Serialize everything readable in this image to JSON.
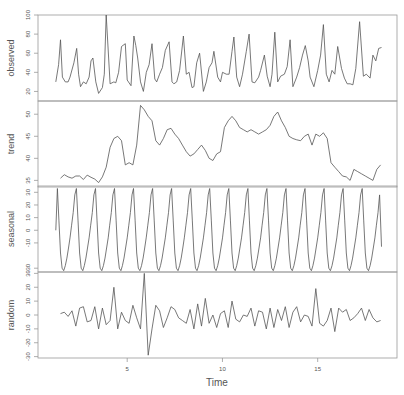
{
  "chart_data": {
    "type": "line",
    "xlabel": "Time",
    "x_range": [
      1,
      18.4
    ],
    "x_ticks": [
      5,
      10,
      15
    ],
    "frequency": 12,
    "grid": false,
    "panels": [
      {
        "name": "observed",
        "ylabel": "observed",
        "ylim": [
          10,
          100
        ],
        "y_ticks": [
          20,
          40,
          60,
          80,
          100
        ],
        "x": [
          1.25,
          1.4,
          1.5,
          1.6,
          1.75,
          1.9,
          2.0,
          2.2,
          2.35,
          2.45,
          2.55,
          2.7,
          2.85,
          3.0,
          3.1,
          3.2,
          3.35,
          3.5,
          3.7,
          3.8,
          3.9,
          4.1,
          4.3,
          4.4,
          4.55,
          4.7,
          4.9,
          5.0,
          5.2,
          5.35,
          5.45,
          5.55,
          5.7,
          5.85,
          6.0,
          6.15,
          6.3,
          6.45,
          6.55,
          6.7,
          6.85,
          7.0,
          7.2,
          7.35,
          7.45,
          7.6,
          7.75,
          7.95,
          8.1,
          8.25,
          8.4,
          8.5,
          8.65,
          8.8,
          9.0,
          9.15,
          9.3,
          9.45,
          9.55,
          9.75,
          9.9,
          10.0,
          10.2,
          10.35,
          10.5,
          10.6,
          10.75,
          10.9,
          11.05,
          11.25,
          11.4,
          11.55,
          11.7,
          11.9,
          12.0,
          12.2,
          12.35,
          12.5,
          12.6,
          12.75,
          12.9,
          13.05,
          13.25,
          13.4,
          13.55,
          13.7,
          13.9,
          14.05,
          14.2,
          14.35,
          14.5,
          14.6,
          14.8,
          15.0,
          15.15,
          15.3,
          15.45,
          15.6,
          15.75,
          15.9,
          16.05,
          16.25,
          16.4,
          16.55,
          16.7,
          16.85,
          17.0,
          17.2,
          17.4,
          17.55,
          17.75,
          17.9,
          18.05,
          18.2,
          18.35
        ],
        "values": [
          30,
          48,
          74,
          35,
          30,
          30,
          35,
          50,
          65,
          38,
          25,
          30,
          28,
          35,
          52,
          55,
          30,
          18,
          24,
          38,
          100,
          28,
          30,
          29,
          40,
          67,
          70,
          32,
          26,
          78,
          68,
          55,
          30,
          20,
          40,
          48,
          70,
          33,
          30,
          38,
          45,
          63,
          72,
          30,
          28,
          30,
          42,
          78,
          38,
          40,
          24,
          25,
          50,
          60,
          20,
          30,
          45,
          50,
          62,
          35,
          30,
          40,
          38,
          38,
          62,
          77,
          35,
          25,
          38,
          62,
          80,
          30,
          29,
          35,
          42,
          58,
          36,
          25,
          38,
          82,
          30,
          36,
          38,
          46,
          74,
          25,
          35,
          45,
          58,
          68,
          52,
          35,
          25,
          42,
          58,
          90,
          38,
          30,
          42,
          38,
          67,
          44,
          34,
          28,
          28,
          27,
          44,
          93,
          36,
          38,
          34,
          58,
          52,
          65,
          66,
          48
        ]
      },
      {
        "name": "trend",
        "ylabel": "trend",
        "ylim": [
          33.5,
          53
        ],
        "y_ticks": [
          35,
          40,
          45,
          50
        ],
        "x": [
          1.5,
          1.7,
          1.9,
          2.1,
          2.3,
          2.5,
          2.7,
          2.9,
          3.1,
          3.3,
          3.5,
          3.7,
          3.9,
          4.1,
          4.3,
          4.5,
          4.7,
          4.9,
          5.1,
          5.3,
          5.5,
          5.7,
          5.9,
          6.1,
          6.3,
          6.5,
          6.7,
          6.9,
          7.1,
          7.3,
          7.5,
          7.7,
          7.9,
          8.1,
          8.3,
          8.5,
          8.7,
          8.9,
          9.1,
          9.3,
          9.5,
          9.7,
          9.9,
          10.1,
          10.3,
          10.5,
          10.7,
          10.9,
          11.1,
          11.3,
          11.5,
          11.7,
          11.9,
          12.1,
          12.3,
          12.5,
          12.7,
          12.9,
          13.1,
          13.3,
          13.5,
          13.7,
          13.9,
          14.1,
          14.3,
          14.5,
          14.7,
          14.9,
          15.1,
          15.3,
          15.5,
          15.7,
          15.9,
          16.1,
          16.3,
          16.5,
          16.7,
          16.9,
          17.1,
          17.3,
          17.5,
          17.7,
          17.9,
          18.1,
          18.3
        ],
        "values": [
          35.5,
          36.3,
          35.8,
          35.5,
          36.0,
          36.0,
          35.2,
          36.2,
          35.7,
          35.3,
          34.5,
          35.8,
          38.0,
          42.5,
          44.5,
          45.0,
          44.0,
          38.5,
          39.0,
          38.5,
          43.0,
          52.0,
          51.0,
          49.5,
          48.5,
          44.0,
          43.0,
          44.5,
          46.5,
          46.8,
          45.5,
          44.5,
          43.0,
          41.5,
          40.5,
          41.0,
          42.0,
          43.0,
          41.8,
          40.0,
          39.5,
          41.0,
          41.5,
          47.0,
          48.5,
          49.5,
          48.5,
          47.0,
          46.5,
          46.0,
          46.5,
          46.0,
          45.5,
          46.0,
          46.5,
          47.5,
          49.5,
          50.5,
          48.5,
          47.0,
          45.0,
          44.5,
          44.2,
          44.0,
          45.0,
          45.5,
          43.0,
          45.5,
          45.0,
          45.8,
          44.5,
          39.0,
          38.0,
          37.0,
          36.0,
          35.8,
          35.0,
          37.5,
          37.0,
          36.5,
          36.0,
          35.5,
          35.0,
          37.5,
          38.5
        ]
      },
      {
        "name": "seasonal",
        "ylabel": "seasonal",
        "ylim": [
          -33,
          35
        ],
        "y_ticks": [
          -30,
          -10,
          0,
          10,
          20,
          30
        ],
        "pattern": [
          33,
          8,
          -18,
          -30,
          -32,
          -28,
          -22,
          -14,
          -6,
          4,
          14,
          28
        ],
        "start_value": 0,
        "end_value": -13
      },
      {
        "name": "random",
        "ylabel": "random",
        "ylim": [
          -31,
          31
        ],
        "y_ticks": [
          -30,
          -20,
          -10,
          0,
          10,
          20,
          30
        ],
        "x": [
          1.5,
          1.7,
          1.9,
          2.1,
          2.3,
          2.5,
          2.7,
          2.9,
          3.1,
          3.3,
          3.5,
          3.7,
          3.9,
          4.1,
          4.3,
          4.5,
          4.7,
          4.9,
          5.1,
          5.3,
          5.5,
          5.7,
          5.9,
          6.1,
          6.3,
          6.5,
          6.7,
          6.9,
          7.1,
          7.3,
          7.5,
          7.7,
          7.9,
          8.1,
          8.3,
          8.5,
          8.7,
          8.9,
          9.1,
          9.3,
          9.5,
          9.7,
          9.9,
          10.1,
          10.3,
          10.5,
          10.7,
          10.9,
          11.1,
          11.3,
          11.5,
          11.7,
          11.9,
          12.1,
          12.3,
          12.5,
          12.7,
          12.9,
          13.1,
          13.3,
          13.5,
          13.7,
          13.9,
          14.1,
          14.3,
          14.5,
          14.7,
          14.9,
          15.1,
          15.3,
          15.5,
          15.7,
          15.9,
          16.1,
          16.3,
          16.5,
          16.7,
          16.9,
          17.1,
          17.3,
          17.5,
          17.7,
          17.9,
          18.1,
          18.3
        ],
        "values": [
          1,
          2,
          -1,
          3,
          -8,
          5,
          6,
          -5,
          -4,
          6,
          -10,
          5,
          -7,
          -4,
          20,
          -10,
          2,
          -4,
          -6,
          7,
          -2,
          -10,
          30,
          -29,
          -10,
          7,
          3,
          -9,
          -2,
          6,
          4,
          -2,
          -4,
          -6,
          4,
          -10,
          8,
          -8,
          12,
          -6,
          0,
          -9,
          1,
          3,
          -9,
          10,
          -3,
          -5,
          0,
          -1,
          5,
          -8,
          3,
          2,
          -10,
          5,
          -9,
          4,
          -4,
          6,
          -9,
          2,
          6,
          -5,
          0,
          -1,
          -8,
          19,
          -6,
          -8,
          -4,
          5,
          -12,
          5,
          2,
          4,
          -4,
          -2,
          1,
          5,
          -4,
          4,
          -2,
          -5,
          -4
        ]
      }
    ]
  }
}
